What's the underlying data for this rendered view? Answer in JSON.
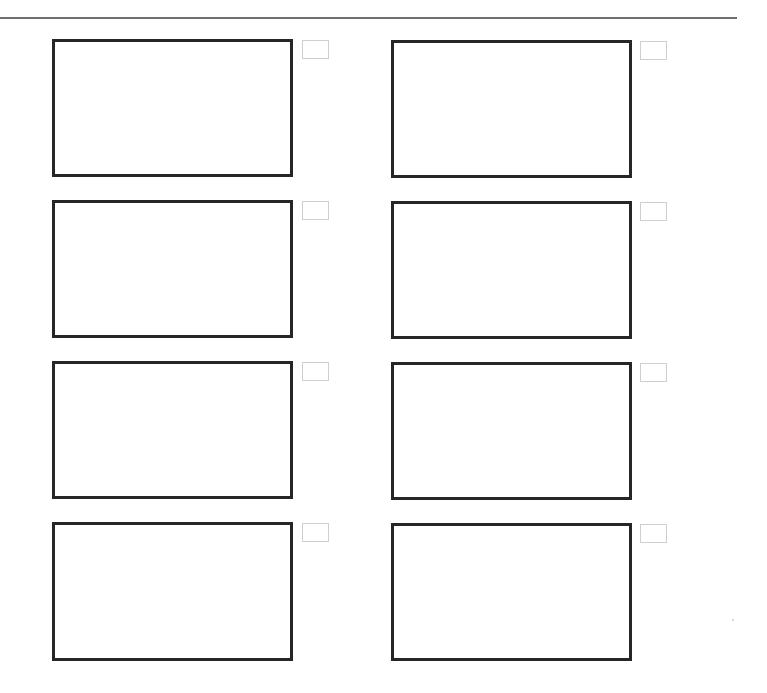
{
  "page": {
    "background": "#ffffff",
    "rule_color": "#6e6e6e",
    "frame_border_color": "#262626",
    "checkbox_border_color": "#cfcfcf"
  },
  "storyboard": {
    "columns": 2,
    "rows": 4,
    "panels": [
      {
        "row": 1,
        "col": 1,
        "text": "",
        "checked": false
      },
      {
        "row": 1,
        "col": 2,
        "text": "",
        "checked": false
      },
      {
        "row": 2,
        "col": 1,
        "text": "",
        "checked": false
      },
      {
        "row": 2,
        "col": 2,
        "text": "",
        "checked": false
      },
      {
        "row": 3,
        "col": 1,
        "text": "",
        "checked": false
      },
      {
        "row": 3,
        "col": 2,
        "text": "",
        "checked": false
      },
      {
        "row": 4,
        "col": 1,
        "text": "",
        "checked": false
      },
      {
        "row": 4,
        "col": 2,
        "text": "",
        "checked": false
      }
    ]
  }
}
